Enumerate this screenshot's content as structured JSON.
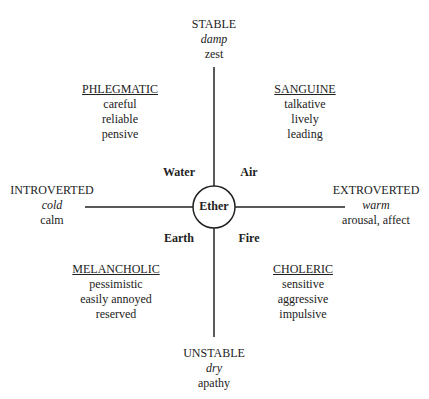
{
  "axes": {
    "top": {
      "label": "STABLE",
      "quality": "damp",
      "trait": "zest"
    },
    "bottom": {
      "label": "UNSTABLE",
      "quality": "dry",
      "trait": "apathy"
    },
    "left": {
      "label": "INTROVERTED",
      "quality": "cold",
      "trait": "calm"
    },
    "right": {
      "label": "EXTROVERTED",
      "quality": "warm",
      "trait": "arousal, affect"
    }
  },
  "center": {
    "label": "Ether"
  },
  "elements": {
    "top_left": "Water",
    "top_right": "Air",
    "bottom_left": "Earth",
    "bottom_right": "Fire"
  },
  "temperaments": [
    {
      "name": "PHLEGMATIC",
      "traits": [
        "careful",
        "reliable",
        "pensive"
      ]
    },
    {
      "name": "SANGUINE",
      "traits": [
        "talkative",
        "lively",
        "leading"
      ]
    },
    {
      "name": "MELANCHOLIC",
      "traits": [
        "pessimistic",
        "easily annoyed",
        "reserved"
      ]
    },
    {
      "name": "CHOLERIC",
      "traits": [
        "sensitive",
        "aggressive",
        "impulsive"
      ]
    }
  ]
}
